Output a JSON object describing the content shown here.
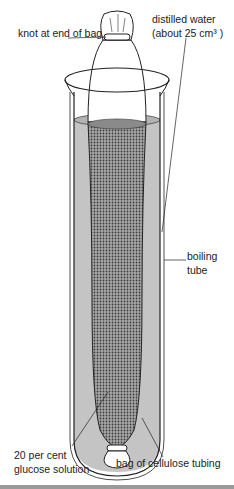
{
  "diagram": {
    "title": "",
    "labels": {
      "knot": "knot at end of bag",
      "water_line1": "distilled water",
      "water_line2": "(about 25 cm³ )",
      "tube_line1": "boiling",
      "tube_line2": "tube",
      "glucose_line1": "20 per cent",
      "glucose_line2": "glucose solution",
      "bag": "bag of cellulose tubing"
    },
    "colors": {
      "outline": "#222222",
      "water": "#bdbdbd",
      "glucose_dots": "#555555",
      "glucose_bg": "#9a9a9a"
    }
  }
}
